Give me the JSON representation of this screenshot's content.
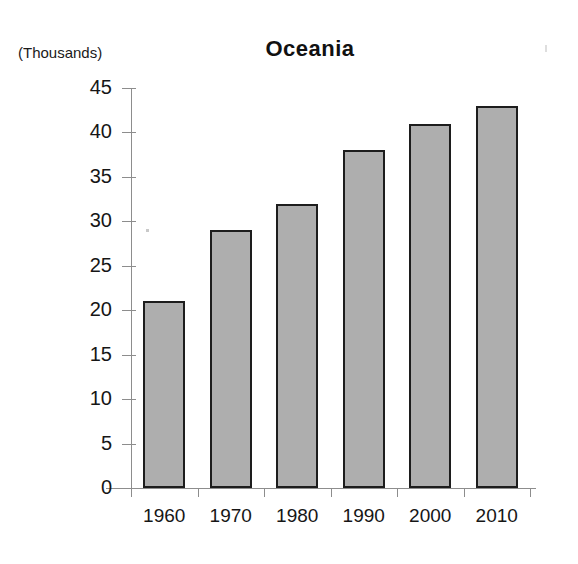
{
  "chart_data": {
    "type": "bar",
    "title": "Oceania",
    "subtitle": "",
    "units_caption": "(Thousands)",
    "xlabel": "",
    "ylabel": "",
    "categories": [
      "1960",
      "1970",
      "1980",
      "1990",
      "2000",
      "2010"
    ],
    "values": [
      21,
      29,
      32,
      38,
      41,
      43
    ],
    "ylim": [
      0,
      45
    ],
    "ytick_step": 5,
    "ytick_labels": [
      "0",
      "5",
      "10",
      "15",
      "20",
      "25",
      "30",
      "35",
      "40",
      "45"
    ],
    "grid": false,
    "legend": null,
    "legend_position": "none",
    "series": [
      {
        "name": "Oceania",
        "values": [
          21,
          29,
          32,
          38,
          41,
          43
        ]
      }
    ],
    "bar_fill_color": "#aeaeae",
    "bar_border_color": "#1d1d1d",
    "axis_color": "#8d8d8d",
    "background_color": "#ffffff",
    "text_color": "#161616"
  }
}
